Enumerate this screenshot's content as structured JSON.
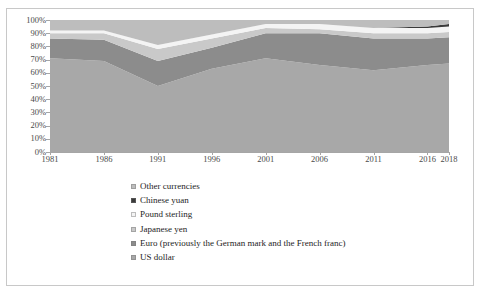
{
  "chart_data": {
    "type": "area",
    "stacked": true,
    "normalized": true,
    "title": "",
    "subtitle": "",
    "xlabel": "",
    "ylabel": "",
    "grid": false,
    "legend_position": "bottom-left",
    "x": [
      1981,
      1986,
      1991,
      1996,
      2001,
      2006,
      2011,
      2016,
      2018
    ],
    "xtick_labels": [
      "1981",
      "1986",
      "1991",
      "1996",
      "2001",
      "2006",
      "2011",
      "2016",
      "2018"
    ],
    "ytick_labels": [
      "0%",
      "10%",
      "20%",
      "30%",
      "40%",
      "50%",
      "60%",
      "70%",
      "80%",
      "90%",
      "100%"
    ],
    "ylim": [
      0,
      100
    ],
    "ytick_step": 10,
    "series": [
      {
        "name": "US dollar",
        "color": "#a8a8a8",
        "values": [
          71,
          69,
          50,
          63,
          71,
          66,
          62,
          66,
          67
        ]
      },
      {
        "name": "Euro (previously the German mark and the French franc)",
        "color": "#8c8c8c",
        "values": [
          15,
          16,
          19,
          16,
          19,
          24,
          24,
          20,
          20
        ]
      },
      {
        "name": "Japanese yen",
        "color": "#c9c9c9",
        "values": [
          4,
          5,
          9,
          7,
          4,
          3,
          4,
          4,
          4
        ]
      },
      {
        "name": "Pound sterling",
        "color": "#f4f4f4",
        "values": [
          2,
          2,
          3,
          3,
          3,
          4,
          4,
          4,
          4
        ]
      },
      {
        "name": "Chinese yuan",
        "color": "#3a3a3a",
        "values": [
          0,
          0,
          0,
          0,
          0,
          0,
          0,
          1,
          2
        ]
      },
      {
        "name": "Other currencies",
        "color": "#bdbdbd",
        "values": [
          8,
          8,
          19,
          11,
          3,
          3,
          6,
          5,
          3
        ]
      }
    ],
    "legend_entries": [
      {
        "label": "Other currencies",
        "color": "#bdbdbd"
      },
      {
        "label": "Chinese yuan",
        "color": "#3a3a3a"
      },
      {
        "label": "Pound sterling",
        "color": "#f4f4f4"
      },
      {
        "label": "Japanese yen",
        "color": "#c9c9c9"
      },
      {
        "label": "Euro (previously the German mark and the French franc)",
        "color": "#8c8c8c"
      },
      {
        "label": "US dollar",
        "color": "#a8a8a8"
      }
    ]
  }
}
